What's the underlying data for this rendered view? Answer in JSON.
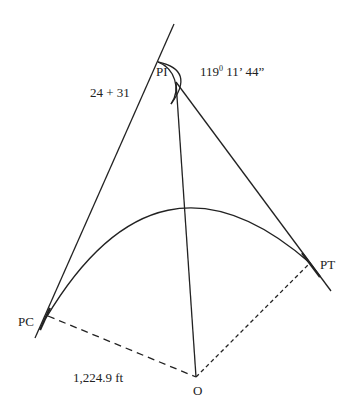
{
  "diagram": {
    "type": "horizontal-curve",
    "points": {
      "pi": {
        "label": "PI",
        "station": "24 + 31"
      },
      "pc": {
        "label": "PC"
      },
      "pt": {
        "label": "PT"
      },
      "o": {
        "label": "O"
      }
    },
    "angle": {
      "deg": "119",
      "deg_symbol": "0",
      "rest": " 11’ 44”"
    },
    "radius_label": "1,224.9 ft",
    "colors": {
      "line": "#222222",
      "background": "#ffffff"
    }
  }
}
